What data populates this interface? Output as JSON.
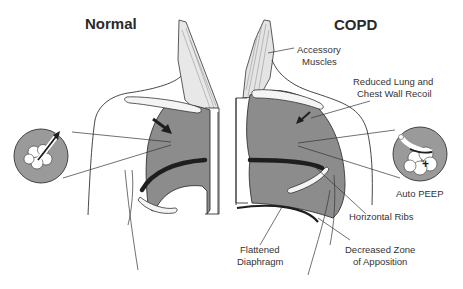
{
  "titles": {
    "normal": "Normal",
    "copd": "COPD"
  },
  "labels": {
    "accessory_muscles": [
      "Accessory",
      "Muscles"
    ],
    "reduced_recoil": [
      "Reduced Lung  and",
      "Chest Wall Recoil"
    ],
    "auto_peep": "Auto PEEP",
    "horizontal_ribs": "Horizontal Ribs",
    "flattened_diaphragm": [
      "Flattened",
      "Diaphragm"
    ],
    "decreased_zone": [
      "Decreased Zone",
      "of Apposition"
    ]
  },
  "insets": {
    "normal_symbol": "",
    "copd_symbol": "+",
    "copd_minus": "–"
  },
  "colors": {
    "lung_fill": "#8c8c8c",
    "inset_fill": "#9a9a9a",
    "outline": "#333333",
    "dark_band": "#1e1e1e",
    "muscle": "#e4e4e4",
    "bone": "#f4f4f4"
  }
}
